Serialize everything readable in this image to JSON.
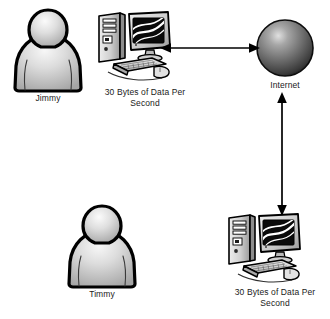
{
  "diagram": {
    "background_color": "#ffffff",
    "text_color": "#1a1a1a",
    "nodes": [
      {
        "id": "person-jimmy",
        "icon": "person-icon",
        "label": "Jimmy",
        "type": "person"
      },
      {
        "id": "pc-top",
        "icon": "desktop-computer-icon",
        "label": "30 Bytes of Data Per\nSecond",
        "type": "computer"
      },
      {
        "id": "cloud-internet",
        "icon": "sphere-icon",
        "label": "Internet",
        "type": "network"
      },
      {
        "id": "person-timmy",
        "icon": "person-icon",
        "label": "Timmy",
        "type": "person"
      },
      {
        "id": "pc-bottom",
        "icon": "desktop-computer-icon",
        "label": "30 Bytes of Data Per\nSecond",
        "type": "computer"
      }
    ],
    "connectors": [
      {
        "id": "arrow-h",
        "icon": "double-arrow-horizontal-icon",
        "from": "pc-top",
        "to": "cloud-internet",
        "direction": "bidirectional",
        "orientation": "horizontal"
      },
      {
        "id": "arrow-v",
        "icon": "double-arrow-vertical-icon",
        "from": "cloud-internet",
        "to": "pc-bottom",
        "direction": "bidirectional",
        "orientation": "vertical"
      }
    ],
    "colors": {
      "outline": "#000000",
      "person_fill_light": "#f2f2f2",
      "person_fill_mid": "#cfcfcf",
      "person_fill_dark": "#a8a8a8",
      "sphere_highlight": "#d8d8d8",
      "sphere_mid": "#6e6e6e",
      "sphere_dark": "#1f1f1f",
      "computer_case": "#c9c9c9",
      "computer_shadow": "#8f8f8f",
      "screen_black": "#0a0a0a",
      "arrow": "#000000"
    }
  }
}
